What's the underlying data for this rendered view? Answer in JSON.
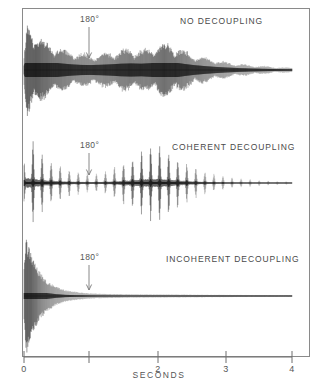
{
  "figure": {
    "background_color": "#ffffff",
    "frame_color": "#8a8a8a",
    "trace_color": "#111111"
  },
  "axis": {
    "label": "SECONDS",
    "ticks": [
      {
        "value": 0,
        "label": "0",
        "x": 24
      },
      {
        "value": 1,
        "label": "",
        "x": 89
      },
      {
        "value": 2,
        "label": "2",
        "x": 158
      },
      {
        "value": 3,
        "label": "3",
        "x": 226
      },
      {
        "value": 4,
        "label": "4",
        "x": 292
      }
    ],
    "xmin": 0,
    "xmax": 4,
    "units": "s"
  },
  "pulse_annotation": {
    "label": "180°",
    "time": 1.0,
    "icon": "down-arrow-icon"
  },
  "panels": [
    {
      "id": "no-decoupling",
      "label": "NO DECOUPLING",
      "baseline_y": 70,
      "label_x": 180,
      "label_y": 24,
      "pulse_label_x": 80,
      "pulse_label_y": 22,
      "arrow_x": 89,
      "arrow_top": 27,
      "arrow_bottom": 58
    },
    {
      "id": "coherent-decoupling",
      "label": "COHERENT  DECOUPLING",
      "baseline_y": 183,
      "label_x": 172,
      "label_y": 150,
      "pulse_label_x": 80,
      "pulse_label_y": 148,
      "arrow_x": 89,
      "arrow_top": 153,
      "arrow_bottom": 175
    },
    {
      "id": "incoherent-decoupling",
      "label": "INCOHERENT  DECOUPLING",
      "baseline_y": 296,
      "label_x": 166,
      "label_y": 262,
      "pulse_label_x": 80,
      "pulse_label_y": 260,
      "arrow_x": 89,
      "arrow_top": 265,
      "arrow_bottom": 290
    }
  ],
  "chart_data": {
    "type": "line",
    "title": "",
    "xlabel": "SECONDS",
    "ylabel": "",
    "xlim": [
      0,
      4
    ],
    "grid": false,
    "legend": "none",
    "annotations": [
      {
        "text": "180°",
        "x": 1.0,
        "note": "refocusing pulse, all three traces"
      },
      {
        "text": "NO DECOUPLING",
        "panel": 0
      },
      {
        "text": "COHERENT  DECOUPLING",
        "panel": 1
      },
      {
        "text": "INCOHERENT  DECOUPLING",
        "panel": 2
      }
    ],
    "series": [
      {
        "name": "NO DECOUPLING",
        "description": "Dense J-modulated FID, slow decay, echo revival near 2 s",
        "carrier_cycles": 150,
        "envelope_x": [
          0.0,
          0.05,
          0.1,
          0.18,
          0.28,
          0.4,
          0.55,
          0.7,
          0.85,
          1.0,
          1.15,
          1.3,
          1.45,
          1.6,
          1.75,
          1.9,
          2.0,
          2.1,
          2.25,
          2.4,
          2.55,
          2.7,
          2.85,
          3.0,
          3.2,
          3.4,
          3.6,
          3.8,
          4.0
        ],
        "envelope_y": [
          0.3,
          0.98,
          0.9,
          0.74,
          0.62,
          0.52,
          0.44,
          0.38,
          0.34,
          0.33,
          0.35,
          0.38,
          0.42,
          0.44,
          0.42,
          0.46,
          0.52,
          0.56,
          0.5,
          0.4,
          0.32,
          0.26,
          0.21,
          0.17,
          0.13,
          0.1,
          0.08,
          0.06,
          0.05
        ]
      },
      {
        "name": "COHERENT  DECOUPLING",
        "description": "Discrete J-beat spikes; spin-echo revival peaking near 2 s",
        "beat_period": 0.135,
        "envelope_x": [
          0.0,
          0.05,
          0.12,
          0.22,
          0.35,
          0.5,
          0.65,
          0.8,
          0.95,
          1.1,
          1.25,
          1.4,
          1.55,
          1.7,
          1.85,
          2.0,
          2.15,
          2.3,
          2.45,
          2.6,
          2.75,
          2.9,
          3.05,
          3.25,
          3.5,
          3.75,
          4.0
        ],
        "envelope_y": [
          0.4,
          1.0,
          0.86,
          0.66,
          0.5,
          0.38,
          0.3,
          0.24,
          0.2,
          0.2,
          0.26,
          0.36,
          0.48,
          0.62,
          0.74,
          0.8,
          0.66,
          0.5,
          0.38,
          0.28,
          0.21,
          0.16,
          0.12,
          0.09,
          0.06,
          0.04,
          0.03
        ]
      },
      {
        "name": "INCOHERENT  DECOUPLING",
        "description": "Rapid monotonic exponential decay, no echo revival",
        "envelope_x": [
          0.0,
          0.03,
          0.08,
          0.15,
          0.25,
          0.35,
          0.48,
          0.62,
          0.78,
          0.95,
          1.1,
          1.3,
          1.55,
          1.8,
          2.1,
          2.4,
          2.7,
          3.0,
          3.4,
          3.7,
          4.0
        ],
        "envelope_y": [
          0.45,
          1.0,
          0.8,
          0.58,
          0.38,
          0.25,
          0.16,
          0.1,
          0.07,
          0.05,
          0.04,
          0.035,
          0.03,
          0.028,
          0.026,
          0.024,
          0.022,
          0.02,
          0.018,
          0.016,
          0.015
        ]
      }
    ]
  }
}
